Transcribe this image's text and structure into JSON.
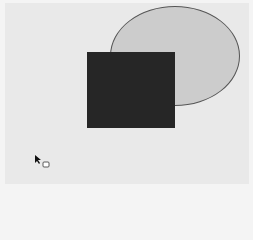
{
  "canvas": {
    "background": "#e9e9e9",
    "shapes": [
      {
        "type": "ellipse",
        "left": 110,
        "top": 6,
        "width": 130,
        "height": 100,
        "fill": "#cccccc",
        "stroke": "#555555"
      },
      {
        "type": "rectangle",
        "left": 87,
        "top": 52,
        "width": 88,
        "height": 76,
        "fill": "#262626"
      }
    ]
  },
  "cursor": {
    "icon": "pointer-with-copy-icon",
    "left": 35,
    "top": 154
  }
}
